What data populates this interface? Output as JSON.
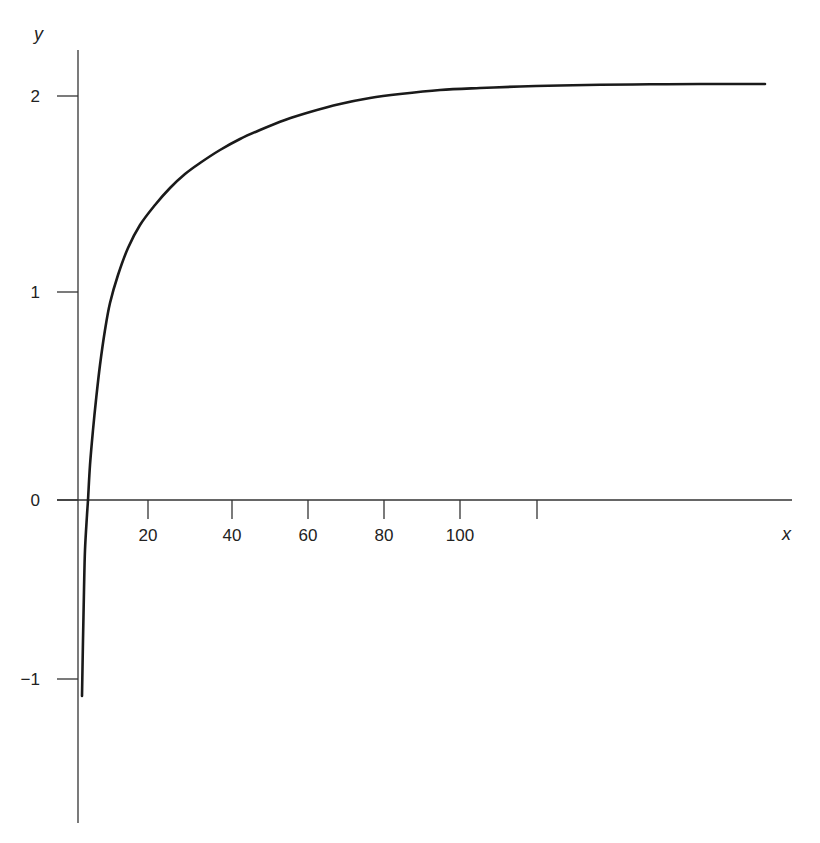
{
  "chart_data": {
    "type": "line",
    "title": "",
    "xlabel": "x",
    "ylabel": "y",
    "grid": false,
    "legend": null,
    "xlim": [
      0,
      140
    ],
    "ylim": [
      -1.6,
      2.2
    ],
    "x_ticks": [
      {
        "value": 20,
        "label": "20",
        "px": 148
      },
      {
        "value": 40,
        "label": "40",
        "px": 232
      },
      {
        "value": 60,
        "label": "60",
        "px": 308
      },
      {
        "value": 80,
        "label": "80",
        "px": 384
      },
      {
        "value": 100,
        "label": "100",
        "px": 460
      },
      {
        "value": 120,
        "label": "",
        "px": 537
      }
    ],
    "y_ticks": [
      {
        "value": 2,
        "label": "2",
        "py": 96
      },
      {
        "value": 1,
        "label": "1",
        "py": 292
      },
      {
        "value": 0,
        "label": "0",
        "py": 500
      },
      {
        "value": -1,
        "label": "−1",
        "py": 679
      }
    ],
    "series": [
      {
        "name": "curve",
        "color": "#1a1a1a",
        "pixel_path": [
          [
            82,
            696
          ],
          [
            83,
            640
          ],
          [
            84,
            590
          ],
          [
            85,
            550
          ],
          [
            87,
            515
          ],
          [
            88,
            500
          ],
          [
            90,
            465
          ],
          [
            93,
            430
          ],
          [
            96,
            400
          ],
          [
            100,
            365
          ],
          [
            105,
            330
          ],
          [
            110,
            303
          ],
          [
            118,
            275
          ],
          [
            128,
            248
          ],
          [
            140,
            225
          ],
          [
            155,
            205
          ],
          [
            170,
            188
          ],
          [
            185,
            174
          ],
          [
            200,
            163
          ],
          [
            220,
            150
          ],
          [
            240,
            139
          ],
          [
            260,
            130
          ],
          [
            285,
            120
          ],
          [
            310,
            112
          ],
          [
            340,
            104
          ],
          [
            370,
            98
          ],
          [
            400,
            94
          ],
          [
            440,
            90
          ],
          [
            480,
            88
          ],
          [
            520,
            86.5
          ],
          [
            560,
            85.5
          ],
          [
            600,
            84.8
          ],
          [
            650,
            84.3
          ],
          [
            700,
            84
          ],
          [
            765,
            84
          ]
        ],
        "approx_points": [
          {
            "x": 2,
            "y": -1.1
          },
          {
            "x": 4,
            "y": 0.0
          },
          {
            "x": 6,
            "y": 0.5
          },
          {
            "x": 8,
            "y": 0.97
          },
          {
            "x": 20,
            "y": 1.45
          },
          {
            "x": 40,
            "y": 1.67
          },
          {
            "x": 60,
            "y": 1.8
          },
          {
            "x": 80,
            "y": 1.88
          },
          {
            "x": 100,
            "y": 1.96
          },
          {
            "x": 120,
            "y": 2.0
          },
          {
            "x": 140,
            "y": 2.05
          }
        ]
      }
    ]
  }
}
